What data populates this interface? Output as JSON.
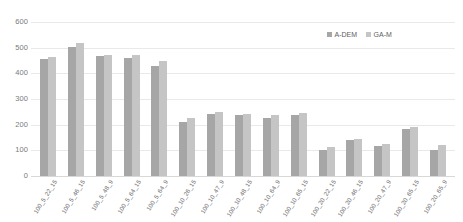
{
  "chart_data": {
    "type": "bar",
    "title": "",
    "xlabel": "",
    "ylabel": "",
    "ylim": [
      0,
      600
    ],
    "yticks": [
      600,
      500,
      400,
      300,
      200,
      100,
      0
    ],
    "grid": true,
    "legend_position": "top-right",
    "categories": [
      "100_5_22_15",
      "100_5_46_15",
      "100_5_48_9",
      "100_5_64_15",
      "100_5_64_9",
      "100_10_26_15",
      "100_10_47_9",
      "100_10_48_15",
      "100_10_64_9",
      "100_10_65_15",
      "100_20_22_15",
      "100_20_46_15",
      "100_20_47_9",
      "100_20_65_15",
      "100_20_65_9"
    ],
    "series": [
      {
        "name": "A-DEM",
        "color": "#a6a6a6",
        "values": [
          455,
          502,
          466,
          458,
          430,
          209,
          240,
          236,
          225,
          238,
          100,
          140,
          118,
          183,
          103
        ]
      },
      {
        "name": "GA-M",
        "color": "#c5c5c5",
        "values": [
          465,
          519,
          472,
          472,
          450,
          225,
          248,
          243,
          238,
          245,
          112,
          143,
          126,
          192,
          120
        ]
      }
    ]
  },
  "legend": {
    "items": [
      {
        "label": "A-DEM",
        "color": "#a6a6a6"
      },
      {
        "label": "GA-M",
        "color": "#c5c5c5"
      }
    ]
  },
  "axis": {
    "y_ticks": [
      "600",
      "500",
      "400",
      "300",
      "200",
      "100",
      "0"
    ]
  }
}
